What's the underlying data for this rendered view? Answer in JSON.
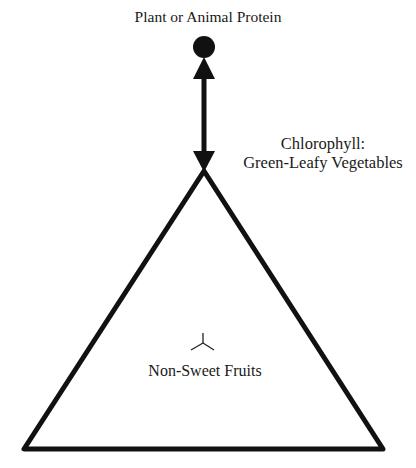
{
  "diagram": {
    "top_node": {
      "label": "Plant or Animal Protein",
      "shape": "filled-circle"
    },
    "connector": {
      "type": "double-headed-arrow",
      "direction": "vertical"
    },
    "apex_label": {
      "line1": "Chlorophyll:",
      "line2": "Green-Leafy Vegetables"
    },
    "triangle": {
      "shape": "triangle-outline",
      "center_mark": "tri-radial-mark"
    },
    "center_label": "Non-Sweet Fruits",
    "colors": {
      "stroke": "#111111",
      "background": "#ffffff",
      "text": "#1a1a1a"
    }
  }
}
